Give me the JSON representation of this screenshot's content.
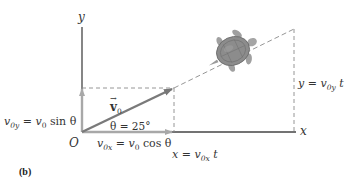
{
  "figure": {
    "panel_label": "(b)",
    "axes": {
      "x_label": "x",
      "y_label": "y",
      "origin_label": "O"
    },
    "vectors": {
      "v0": {
        "symbol": "v",
        "subscript": "0",
        "angle_label": "θ = 25°"
      },
      "v0x": {
        "lhs": "v",
        "lhs_sub": "0x",
        "eq": " = ",
        "rhs": "v",
        "rhs_sub": "0",
        "rhs_tail": " cos θ"
      },
      "v0y": {
        "lhs": "v",
        "lhs_sub": "0y",
        "eq": " = ",
        "rhs": "v",
        "rhs_sub": "0",
        "rhs_tail": " sin θ"
      }
    },
    "displacements": {
      "x": {
        "lhs": "x",
        "eq": " = ",
        "rhs": "v",
        "rhs_sub": "0x",
        "tail": " t"
      },
      "y": {
        "lhs": "y",
        "eq": " = ",
        "rhs": "v",
        "rhs_sub": "0y",
        "tail": " t"
      }
    },
    "object": "turtle-icon",
    "colors": {
      "axis": "#444444",
      "vector": "#7a7a7a",
      "component": "#a8a8a8",
      "dashed": "#8a8a8a",
      "turtle_shell": "#8c8c8c",
      "turtle_body": "#a5a5a5"
    }
  }
}
